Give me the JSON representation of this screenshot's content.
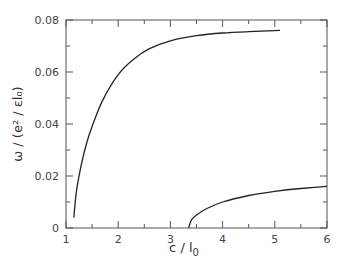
{
  "chart_data": {
    "type": "line",
    "title": "",
    "xlabel": "c / l0",
    "ylabel": "ω / (e² / εl0)",
    "xlim": [
      1,
      6
    ],
    "ylim": [
      0,
      0.08
    ],
    "xticks": [
      1,
      2,
      3,
      4,
      5,
      6
    ],
    "xtick_labels": [
      "1",
      "2",
      "3",
      "4",
      "5",
      "6"
    ],
    "xminor_ticks": [
      1.5,
      2.5,
      3.5,
      4.5,
      5.5
    ],
    "yticks": [
      0,
      0.02,
      0.04,
      0.06,
      0.08
    ],
    "ytick_labels": [
      "0",
      "0.02",
      "0.04",
      "0.06",
      "0.08"
    ],
    "yminor_ticks": [
      0.01,
      0.03,
      0.05,
      0.07
    ],
    "grid": false,
    "legend": null,
    "series": [
      {
        "name": "upper branch",
        "x": [
          1.15,
          1.2,
          1.3,
          1.4,
          1.5,
          1.7,
          2.0,
          2.3,
          2.6,
          3.0,
          3.5,
          4.0,
          4.5,
          5.1
        ],
        "y": [
          0.004,
          0.014,
          0.025,
          0.033,
          0.039,
          0.049,
          0.059,
          0.065,
          0.069,
          0.072,
          0.074,
          0.075,
          0.0755,
          0.076
        ]
      },
      {
        "name": "lower branch",
        "x": [
          3.35,
          3.4,
          3.5,
          3.7,
          4.0,
          4.5,
          5.0,
          5.5,
          6.0
        ],
        "y": [
          0.0,
          0.003,
          0.005,
          0.0075,
          0.01,
          0.0125,
          0.0141,
          0.0152,
          0.016
        ]
      }
    ]
  },
  "labels": {
    "xlabel_main": "c / l",
    "xlabel_sub": "0",
    "ylabel_text": "ω / (e² / εl₀)"
  }
}
